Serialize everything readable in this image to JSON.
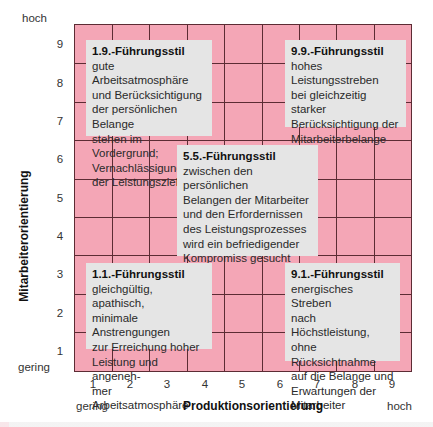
{
  "y_axis": {
    "title": "Mitarbeiterorientierung",
    "high_label": "hoch",
    "low_label": "gering",
    "ticks": [
      "9",
      "8",
      "7",
      "6",
      "5",
      "4",
      "3",
      "2",
      "1"
    ]
  },
  "x_axis": {
    "title": "Produktionsorientierung",
    "low_label": "gering",
    "high_label": "hoch",
    "ticks": [
      "1",
      "2",
      "3",
      "4",
      "5",
      "6",
      "7",
      "8",
      "9"
    ]
  },
  "colors": {
    "grid_fill": "#f4a6b6",
    "grid_lines": "#5c2c34",
    "box_fill": "#e5e5e5"
  },
  "styles": {
    "s19": {
      "title": "1.9.-Führungsstil",
      "lines": [
        "gute Arbeitsatmosphäre",
        "und Berücksichtigung",
        "der persönlichen Belange",
        "stehen im Vordergrund;",
        "Vernachlässigung",
        "der Leistungsziele"
      ]
    },
    "s99": {
      "title": "9.9.-Führungsstil",
      "lines": [
        "hohes Leistungsstreben",
        "bei gleichzeitig starker",
        "Berücksichtigung der",
        "Mitarbeiterbelange"
      ]
    },
    "s55": {
      "title": "5.5.-Führungsstil",
      "lines": [
        "zwischen den persönlichen",
        "Belangen der Mitarbeiter",
        "und den Erfordernissen",
        "des Leistungsprozesses",
        "wird ein befriedigender",
        "Kompromiss gesucht"
      ]
    },
    "s11": {
      "title": "1.1.-Führungsstil",
      "lines": [
        "gleichgültig, apathisch,",
        "minimale Anstrengungen",
        "zur Erreichung hoher",
        "Leistung und angeneh-",
        "mer Arbeitsatmosphäre"
      ]
    },
    "s91": {
      "title": "9.1.-Führungsstil",
      "lines": [
        "energisches Streben",
        "nach Höchstleistung,",
        "ohne Rücksichtnahme",
        "auf die Belange und",
        "Erwartungen der",
        "Mitarbeiter"
      ]
    }
  }
}
